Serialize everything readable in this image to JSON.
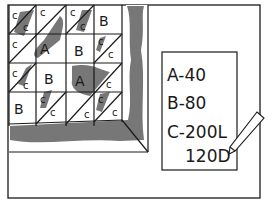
{
  "illustration": {
    "subject": "quilt block layout with piece-count note",
    "colors": {
      "ink": "#1a1a1a",
      "shade": "#777777",
      "paper": "#ffffff"
    }
  },
  "quilt": {
    "pieces": {
      "large_triangle": "A",
      "square": "B",
      "small_triangle": "C"
    },
    "labels": {
      "a1": "A",
      "a2": "A",
      "b1": "B",
      "b2": "B",
      "b3": "B",
      "b4": "B",
      "c": "c"
    }
  },
  "note": {
    "lines": [
      "A-40",
      "B-80",
      "C-200L",
      "120D"
    ]
  }
}
